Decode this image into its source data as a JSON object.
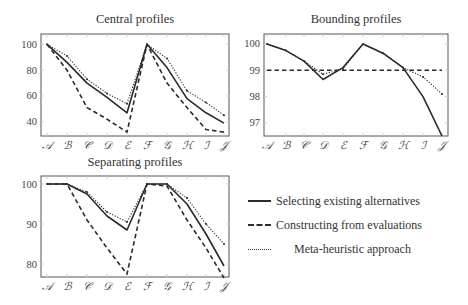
{
  "chart_data": [
    {
      "type": "line",
      "title": "Central profiles",
      "categories": [
        "A",
        "B",
        "C",
        "D",
        "E",
        "F",
        "G",
        "H",
        "I",
        "J"
      ],
      "ylim": [
        29,
        108
      ],
      "yticks": [
        40,
        60,
        80,
        100
      ],
      "grid": false,
      "series": [
        {
          "name": "Selecting existing alternatives",
          "style": "solid",
          "values": [
            100,
            86,
            70,
            59,
            47,
            100,
            82,
            58,
            47,
            39
          ]
        },
        {
          "name": "Constructing from evaluations",
          "style": "dashed",
          "values": [
            100,
            80,
            51,
            42,
            32,
            100,
            70,
            51,
            34,
            32
          ]
        },
        {
          "name": "Meta-heuristic approach",
          "style": "dotted",
          "values": [
            100,
            91,
            73,
            62,
            54,
            100,
            89,
            64,
            55,
            45
          ]
        }
      ],
      "frame": {
        "left": 41,
        "right": 229,
        "top": 34,
        "bottom": 136
      },
      "xpos": [
        47,
        67,
        87,
        107,
        127,
        147,
        167,
        187,
        206,
        224
      ]
    },
    {
      "type": "line",
      "title": "Bounding profiles",
      "categories": [
        "A",
        "B",
        "C",
        "D",
        "E",
        "F",
        "G",
        "H",
        "I",
        "J"
      ],
      "ylim": [
        96.5,
        100.38
      ],
      "yticks": [
        97,
        98,
        99,
        100
      ],
      "grid": false,
      "series": [
        {
          "name": "Selecting existing alternatives",
          "style": "solid",
          "values": [
            100,
            99.75,
            99.35,
            98.65,
            99.1,
            100,
            99.65,
            99.1,
            98.0,
            96.5
          ]
        },
        {
          "name": "Constructing from evaluations",
          "style": "dashed",
          "values": [
            99,
            99,
            99,
            99,
            99,
            99,
            99,
            99,
            99,
            99
          ]
        },
        {
          "name": "Meta-heuristic approach",
          "style": "dotted",
          "values": [
            100,
            99.75,
            99.35,
            98.85,
            99.05,
            100,
            99.65,
            99.1,
            98.75,
            98.1
          ]
        }
      ],
      "frame": {
        "left": 264,
        "right": 448,
        "top": 34,
        "bottom": 136
      },
      "xpos": [
        267,
        286,
        304,
        323,
        343,
        363,
        383,
        403,
        423,
        442
      ]
    },
    {
      "type": "line",
      "title": "Separating profiles",
      "categories": [
        "A",
        "B",
        "C",
        "D",
        "E",
        "F",
        "G",
        "H",
        "I",
        "J"
      ],
      "ylim": [
        76.75,
        102
      ],
      "yticks": [
        80,
        90,
        100
      ],
      "grid": false,
      "series": [
        {
          "name": "Selecting existing alternatives",
          "style": "solid",
          "values": [
            100,
            100,
            97.5,
            92,
            88.5,
            100,
            100,
            95,
            87.5,
            79.5
          ]
        },
        {
          "name": "Constructing from evaluations",
          "style": "dashed",
          "values": [
            100,
            100,
            91,
            84,
            77.5,
            100,
            99.5,
            91,
            84,
            76.5
          ]
        },
        {
          "name": "Meta-heuristic approach",
          "style": "dotted",
          "values": [
            100,
            100,
            98,
            93,
            90.5,
            100,
            100,
            96.5,
            90,
            85
          ]
        }
      ],
      "frame": {
        "left": 41,
        "right": 229,
        "top": 176,
        "bottom": 277
      },
      "xpos": [
        47,
        67,
        87,
        107,
        127,
        147,
        167,
        187,
        206,
        224
      ]
    }
  ],
  "titles": {
    "central": "Central profiles",
    "bounding": "Bounding profiles",
    "separating": "Separating profiles"
  },
  "legend": [
    {
      "label": "Selecting existing alternatives",
      "style": "solid"
    },
    {
      "label": "Constructing from evaluations",
      "style": "dashed"
    },
    {
      "label": "Meta-heuristic approach",
      "style": "dotted"
    }
  ],
  "colors": {
    "line": "#2b2b2b",
    "frame": "#555555",
    "tick": "#cccccc"
  }
}
